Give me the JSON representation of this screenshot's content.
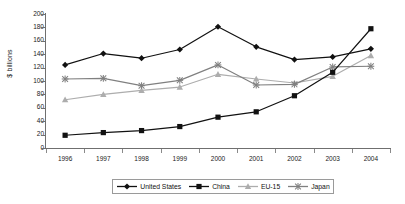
{
  "chart": {
    "ylabel": "$ billions",
    "ytick_labels": [
      "200",
      "180",
      "160",
      "140",
      "120",
      "100",
      "80",
      "60",
      "40",
      "20",
      "0"
    ],
    "xtick_labels": [
      "1996",
      "1997",
      "1998",
      "1999",
      "2000",
      "2001",
      "2002",
      "2003",
      "2004"
    ]
  },
  "legend": {
    "items": [
      {
        "label": "United States",
        "marker": "diamond-marker",
        "color": "#111111"
      },
      {
        "label": "China",
        "marker": "square-marker",
        "color": "#111111"
      },
      {
        "label": "EU-15",
        "marker": "triangle-marker",
        "color": "#adadad"
      },
      {
        "label": "Japan",
        "marker": "cross-marker",
        "color": "#808080"
      }
    ]
  },
  "chart_data": {
    "type": "line",
    "title": "",
    "xlabel": "",
    "ylabel": "$ billions",
    "ylim": [
      0,
      200
    ],
    "ytick_step": 20,
    "grid": false,
    "legend_position": "bottom",
    "categories": [
      "1996",
      "1997",
      "1998",
      "1999",
      "2000",
      "2001",
      "2002",
      "2003",
      "2004"
    ],
    "series": [
      {
        "name": "United States",
        "color": "#111111",
        "marker": "diamond",
        "values": [
          124,
          141,
          134,
          147,
          181,
          151,
          132,
          136,
          148
        ]
      },
      {
        "name": "China",
        "color": "#111111",
        "marker": "square",
        "values": [
          19,
          23,
          26,
          32,
          46,
          54,
          78,
          113,
          178
        ]
      },
      {
        "name": "EU-15",
        "color": "#adadad",
        "marker": "triangle",
        "values": [
          72,
          80,
          86,
          91,
          110,
          103,
          97,
          107,
          138
        ]
      },
      {
        "name": "Japan",
        "color": "#808080",
        "marker": "cross",
        "values": [
          103,
          104,
          93,
          101,
          124,
          94,
          95,
          121,
          122
        ]
      }
    ]
  }
}
